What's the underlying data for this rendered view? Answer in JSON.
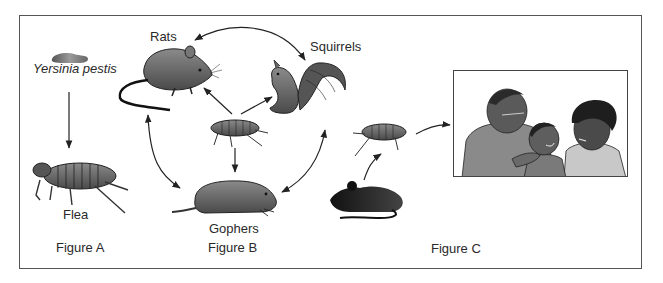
{
  "diagram": {
    "frame_color": "#555555",
    "figures": [
      {
        "id": "A",
        "caption": "Figure A",
        "nodes": [
          {
            "name": "yersinia-pestis",
            "label": "Yersinia pestis",
            "style": "italic",
            "icon": "bacterium-icon"
          },
          {
            "name": "flea",
            "label": "Flea",
            "icon": "flea-icon"
          }
        ],
        "edges": [
          {
            "from": "yersinia-pestis",
            "to": "flea",
            "direction": "one-way"
          }
        ]
      },
      {
        "id": "B",
        "caption": "Figure B",
        "nodes": [
          {
            "name": "rats",
            "label": "Rats",
            "icon": "rat-icon"
          },
          {
            "name": "squirrels",
            "label": "Squirrels",
            "icon": "squirrel-icon"
          },
          {
            "name": "flea",
            "label": "",
            "icon": "flea-icon"
          },
          {
            "name": "gophers",
            "label": "Gophers",
            "icon": "gopher-icon"
          }
        ],
        "edges": [
          {
            "from": "flea",
            "to": "rats",
            "direction": "one-way"
          },
          {
            "from": "flea",
            "to": "squirrels",
            "direction": "one-way"
          },
          {
            "from": "flea",
            "to": "gophers",
            "direction": "one-way"
          },
          {
            "from": "rats",
            "to": "squirrels",
            "direction": "two-way"
          },
          {
            "from": "rats",
            "to": "gophers",
            "direction": "two-way"
          },
          {
            "from": "squirrels",
            "to": "gophers",
            "direction": "two-way"
          }
        ]
      },
      {
        "id": "C",
        "caption": "Figure C",
        "nodes": [
          {
            "name": "rodent",
            "label": "",
            "icon": "rodent-silhouette-icon"
          },
          {
            "name": "flea",
            "label": "",
            "icon": "flea-icon"
          },
          {
            "name": "humans",
            "label": "",
            "icon": "family-illustration"
          }
        ],
        "edges": [
          {
            "from": "rodent",
            "to": "flea",
            "direction": "one-way"
          },
          {
            "from": "flea",
            "to": "humans",
            "direction": "one-way"
          }
        ]
      }
    ]
  }
}
